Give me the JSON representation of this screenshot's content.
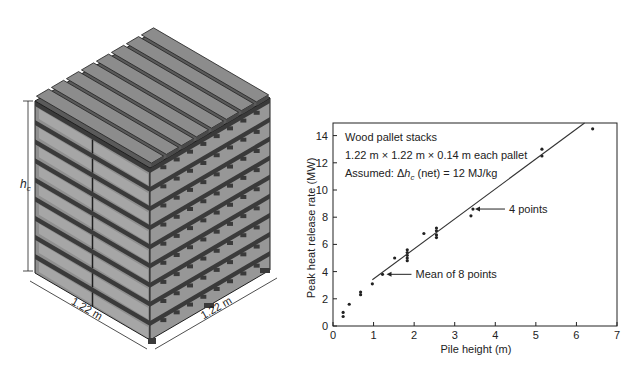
{
  "illustration": {
    "title": "Wood pallet stack",
    "height_label": "h",
    "height_label_sub": "c",
    "width_label_left": "1.22 m",
    "width_label_right": "1.22 m",
    "pallet_count": 9,
    "top_slat_count": 8,
    "colors": {
      "face": "#8f8f8f",
      "dark": "#3a3a3a",
      "light": "#a6a6a6",
      "edge": "#1e1e1e"
    }
  },
  "chart_data": {
    "type": "scatter",
    "title": "",
    "xlabel": "Pile height (m)",
    "ylabel": "Peak heat release rate (MW)",
    "xlim": [
      0,
      7
    ],
    "ylim": [
      0,
      15
    ],
    "xticks": [
      0,
      1,
      2,
      3,
      4,
      5,
      6,
      7
    ],
    "yticks": [
      0,
      2,
      4,
      6,
      8,
      10,
      12,
      14
    ],
    "grid": false,
    "legend": null,
    "annotation_box": [
      "Wood pallet stacks",
      "1.22 m × 1.22 m × 0.14 m each pallet",
      "Assumed: Δh_c (net) = 12 MJ/kg"
    ],
    "annotations": [
      {
        "text": "4 points",
        "x": 3.45,
        "y": 8.6
      },
      {
        "text": "Mean of 8 points",
        "x": 1.22,
        "y": 3.8
      }
    ],
    "series": [
      {
        "name": "Measured",
        "points": [
          [
            0.25,
            0.7
          ],
          [
            0.25,
            1.0
          ],
          [
            0.4,
            1.6
          ],
          [
            0.68,
            2.3
          ],
          [
            0.68,
            2.5
          ],
          [
            0.97,
            3.1
          ],
          [
            1.22,
            3.8
          ],
          [
            1.52,
            5.0
          ],
          [
            1.83,
            4.8
          ],
          [
            1.83,
            5.0
          ],
          [
            1.83,
            5.2
          ],
          [
            1.83,
            5.4
          ],
          [
            1.83,
            5.6
          ],
          [
            2.24,
            6.8
          ],
          [
            2.55,
            6.5
          ],
          [
            2.55,
            6.7
          ],
          [
            2.55,
            7.0
          ],
          [
            2.55,
            7.2
          ],
          [
            3.4,
            8.1
          ],
          [
            3.45,
            8.6
          ],
          [
            5.15,
            12.5
          ],
          [
            5.15,
            13.0
          ],
          [
            6.4,
            14.5
          ]
        ]
      },
      {
        "name": "Fit line",
        "type": "line",
        "points": [
          [
            0.97,
            3.4
          ],
          [
            6.2,
            15.0
          ]
        ]
      }
    ]
  }
}
